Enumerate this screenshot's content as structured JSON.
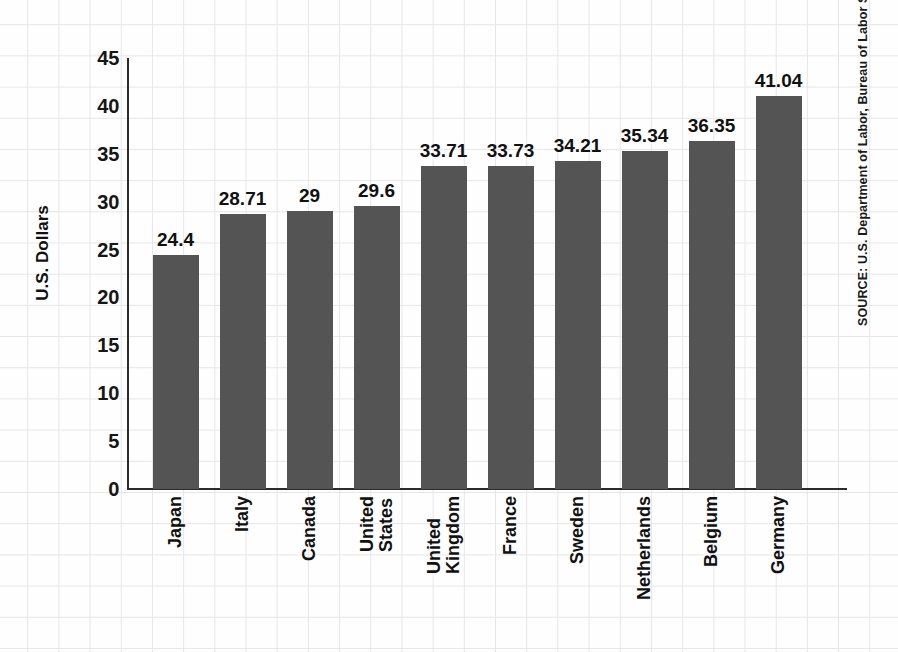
{
  "chart_data": {
    "type": "bar",
    "title": "",
    "subtitle": "",
    "xlabel": "",
    "ylabel": "U.S. Dollars",
    "ylim": [
      0,
      45
    ],
    "yticks": [
      45,
      40,
      35,
      30,
      25,
      20,
      15,
      10,
      5,
      0
    ],
    "grid": true,
    "legend": "none",
    "bar_color": "#545454",
    "categories": [
      "Japan",
      "Italy",
      "Canada",
      "United States",
      "United Kingdom",
      "France",
      "Sweden",
      "Netherlands",
      "Belgium",
      "Germany"
    ],
    "category_lines": [
      [
        "Japan"
      ],
      [
        "Italy"
      ],
      [
        "Canada"
      ],
      [
        "United",
        "States"
      ],
      [
        "United",
        "Kingdom"
      ],
      [
        "France"
      ],
      [
        "Sweden"
      ],
      [
        "Netherlands"
      ],
      [
        "Belgium"
      ],
      [
        "Germany"
      ]
    ],
    "values": [
      24.4,
      28.71,
      29,
      29.6,
      33.71,
      33.73,
      34.21,
      35.34,
      36.35,
      41.04
    ],
    "value_labels": [
      "24.4",
      "28.71",
      "29",
      "29.6",
      "33.71",
      "33.73",
      "34.21",
      "35.34",
      "36.35",
      "41.04"
    ]
  },
  "footer": {
    "source": "SOURCE: U.S. Department of Labor, Bureau of Labor Statistics"
  }
}
